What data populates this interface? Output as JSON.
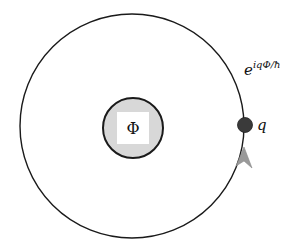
{
  "diagram": {
    "type": "aharonov-bohm-flux-loop",
    "outer_loop": {
      "cx": 132,
      "cy": 126,
      "r": 112,
      "stroke": "#1a1a1a"
    },
    "flux_tube": {
      "cx": 133,
      "cy": 128,
      "r": 30,
      "fill": "#d8d8d8",
      "stroke": "#1a1a1a",
      "label": "Φ",
      "label_box_fill": "#ffffff"
    },
    "charge": {
      "cx": 245,
      "cy": 125,
      "r": 7,
      "fill": "#3a3a3a",
      "label": "q"
    },
    "direction_arrow": {
      "tip_x": 244,
      "tip_y": 148,
      "fill": "#9a9a9a",
      "direction": "up"
    },
    "phase_label": {
      "base": "e",
      "exponent": "iqΦ/ħ"
    }
  }
}
